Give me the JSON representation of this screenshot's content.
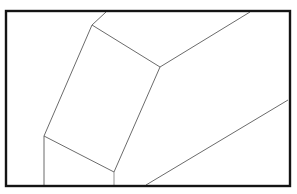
{
  "figure": {
    "canvas": {
      "width": 297,
      "height": 194,
      "background": "#ffffff"
    },
    "frame": {
      "label": "picture-frame-border",
      "x": 6,
      "y": 11,
      "width": 284,
      "height": 175,
      "stroke_color": "#141414",
      "stroke_width": 2.4,
      "fill": "none"
    },
    "shapes": {
      "main_face": {
        "label": "parallelogram-face",
        "points": "92,25 160,67 114,172 44,136",
        "fill": "#ffffff",
        "stroke_color": "#5a5a5a",
        "stroke_width": 0.9
      }
    },
    "lines": [
      {
        "name": "face-edge-top",
        "x1": 92,
        "y1": 25,
        "x2": 160,
        "y2": 67,
        "stroke_color": "#5a5a5a",
        "stroke_width": 0.9
      },
      {
        "name": "face-edge-right",
        "x1": 160,
        "y1": 67,
        "x2": 114,
        "y2": 172,
        "stroke_color": "#5a5a5a",
        "stroke_width": 0.9
      },
      {
        "name": "face-edge-bottom",
        "x1": 114,
        "y1": 172,
        "x2": 44,
        "y2": 136,
        "stroke_color": "#5a5a5a",
        "stroke_width": 0.9
      },
      {
        "name": "face-edge-left",
        "x1": 44,
        "y1": 136,
        "x2": 92,
        "y2": 25,
        "stroke_color": "#5a5a5a",
        "stroke_width": 0.9
      },
      {
        "name": "top-vertical-edge-to-frame",
        "x1": 92,
        "y1": 25,
        "x2": 106,
        "y2": 12,
        "stroke_color": "#5a5a5a",
        "stroke_width": 0.9
      },
      {
        "name": "upper-ridge-edge-to-frame",
        "x1": 160,
        "y1": 67,
        "x2": 250,
        "y2": 12,
        "stroke_color": "#5a5a5a",
        "stroke_width": 0.9
      },
      {
        "name": "left-vertical-edge-to-frame",
        "x1": 44,
        "y1": 136,
        "x2": 44,
        "y2": 185,
        "stroke_color": "#5a5a5a",
        "stroke_width": 0.9
      },
      {
        "name": "bottom-vertical-stub-to-frame",
        "x1": 114,
        "y1": 172,
        "x2": 114,
        "y2": 185,
        "stroke_color": "#878787",
        "stroke_width": 0.9
      },
      {
        "name": "lower-right-diagonal-edge",
        "x1": 146,
        "y1": 185,
        "x2": 288,
        "y2": 100,
        "stroke_color": "#5a5a5a",
        "stroke_width": 0.9
      }
    ]
  }
}
